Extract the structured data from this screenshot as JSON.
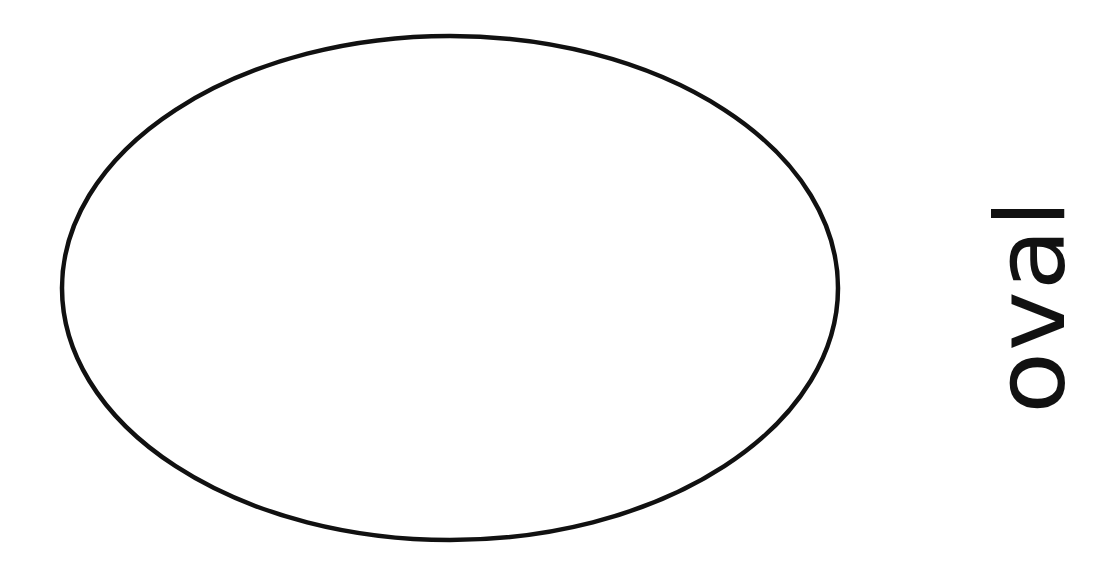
{
  "figure": {
    "shape": {
      "type": "ellipse",
      "cx": 450,
      "cy": 288,
      "rx": 388,
      "ry": 252,
      "stroke": "#111111",
      "stroke_width": 4.5,
      "fill": "#ffffff"
    },
    "label": "oval",
    "label_color": "#111111",
    "background": "#ffffff"
  }
}
